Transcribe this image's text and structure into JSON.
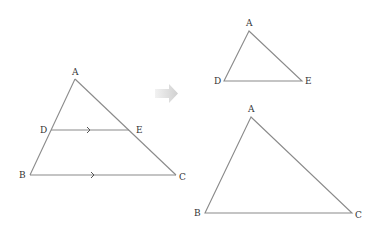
{
  "diagram": {
    "type": "similar-triangles-decomposition",
    "colors": {
      "edge": "#8a8a8a",
      "label": "#333333",
      "arrow_light": "#f0f0f0",
      "arrow_dark": "#cfcfcf"
    },
    "left_figure": {
      "points": {
        "A": {
          "label": "A",
          "x": 75,
          "y": 79
        },
        "D": {
          "label": "D",
          "x": 51,
          "y": 130
        },
        "E": {
          "label": "E",
          "x": 129,
          "y": 130
        },
        "B": {
          "label": "B",
          "x": 30,
          "y": 175
        },
        "C": {
          "label": "C",
          "x": 176,
          "y": 175
        }
      },
      "parallel_marks": [
        "DE",
        "BC"
      ]
    },
    "transition_arrow": {
      "icon": "right-arrow-icon"
    },
    "small_triangle": {
      "points": {
        "A": {
          "label": "A",
          "x": 249,
          "y": 31
        },
        "D": {
          "label": "D",
          "x": 224,
          "y": 81
        },
        "E": {
          "label": "E",
          "x": 302,
          "y": 81
        }
      }
    },
    "large_triangle": {
      "points": {
        "A": {
          "label": "A",
          "x": 251,
          "y": 117
        },
        "B": {
          "label": "B",
          "x": 205,
          "y": 213
        },
        "C": {
          "label": "C",
          "x": 352,
          "y": 213
        }
      }
    }
  }
}
